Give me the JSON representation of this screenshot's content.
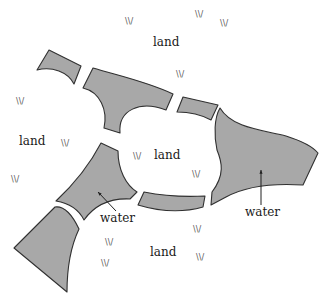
{
  "diagram": {
    "type": "landscape-region-map",
    "colors": {
      "water_fill": "#a8a8a8",
      "outline": "#303030",
      "background": "#ffffff",
      "text": "#1a1a1a",
      "grass": "#555555"
    },
    "land_labels": [
      {
        "text": "land",
        "x": 153,
        "y": 46
      },
      {
        "text": "land",
        "x": 19,
        "y": 145
      },
      {
        "text": "land",
        "x": 154,
        "y": 159
      },
      {
        "text": "land",
        "x": 150,
        "y": 256
      }
    ],
    "water_labels": [
      {
        "text": "water",
        "x": 100,
        "y": 222,
        "arrow_to": [
          98,
          192
        ]
      },
      {
        "text": "water",
        "x": 245,
        "y": 216,
        "arrow_to": [
          261,
          170
        ]
      }
    ],
    "grass_symbol": "\\\\/",
    "grass_marks": [
      {
        "x": 125,
        "y": 24
      },
      {
        "x": 195,
        "y": 17
      },
      {
        "x": 220,
        "y": 26
      },
      {
        "x": 176,
        "y": 77
      },
      {
        "x": 16,
        "y": 104
      },
      {
        "x": 61,
        "y": 146
      },
      {
        "x": 11,
        "y": 182
      },
      {
        "x": 133,
        "y": 159
      },
      {
        "x": 192,
        "y": 177
      },
      {
        "x": 105,
        "y": 245
      },
      {
        "x": 101,
        "y": 266
      },
      {
        "x": 193,
        "y": 232
      },
      {
        "x": 196,
        "y": 260
      }
    ],
    "water_pieces": [
      {
        "id": "top-left-small",
        "path": "M37,70 L49,50 L81,66 L74,84 C68,72 52,66 37,70 Z"
      },
      {
        "id": "top-arch",
        "path": "M83,88 L93,68 C120,76 148,82 173,94 L166,110 C140,100 118,110 120,133 L104,128 C108,110 100,92 83,88 Z"
      },
      {
        "id": "top-right-small",
        "path": "M177,112 L183,97 L218,105 L211,120 C200,114 188,112 177,112 Z"
      },
      {
        "id": "right-large",
        "path": "M220,108 C232,128 262,130 286,136 C302,141 312,146 318,153 L303,185 C272,183 246,186 226,197 L211,205 L212,192 C225,175 222,162 217,150 C214,136 214,118 220,108 Z"
      },
      {
        "id": "left-center",
        "path": "M56,201 C72,186 88,168 101,143 L118,151 C118,170 126,185 137,192 L130,199 C110,198 94,206 84,220 C78,208 68,203 56,201 Z"
      },
      {
        "id": "bottom-middle",
        "path": "M138,205 L144,192 C164,196 186,197 205,196 L203,207 C182,213 158,211 138,205 Z"
      },
      {
        "id": "bottom-left",
        "path": "M14,248 L55,207 C62,206 70,210 79,229 C70,248 67,270 67,292 Z"
      }
    ]
  }
}
